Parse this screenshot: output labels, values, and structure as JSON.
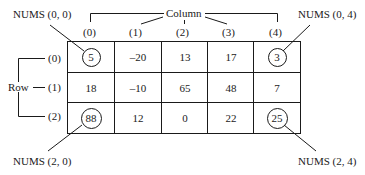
{
  "diagram": {
    "column_label": "Column",
    "row_label": "Row",
    "column_indices": [
      "(0)",
      "(1)",
      "(2)",
      "(3)",
      "(4)"
    ],
    "row_indices": [
      "(0)",
      "(1)",
      "(2)"
    ],
    "matrix": [
      [
        "5",
        "–20",
        "13",
        "17",
        "3"
      ],
      [
        "18",
        "–10",
        "65",
        "48",
        "7"
      ],
      [
        "88",
        "12",
        "0",
        "22",
        "25"
      ]
    ],
    "callouts": {
      "top_left": "NUMS (0, 0)",
      "top_right": "NUMS (0, 4)",
      "bottom_left": "NUMS (2, 0)",
      "bottom_right": "NUMS (2, 4)"
    },
    "highlighted_cells": [
      [
        0,
        0
      ],
      [
        0,
        4
      ],
      [
        2,
        0
      ],
      [
        2,
        4
      ]
    ],
    "line_color": "#1a1a1a"
  }
}
